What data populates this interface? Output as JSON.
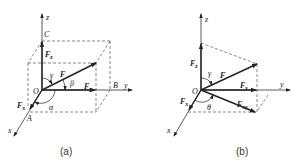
{
  "figure": {
    "panels": [
      {
        "id": "a",
        "caption": "(a)",
        "labels": {
          "z": "z",
          "y": "y",
          "x": "x",
          "origin": "O",
          "C": "C",
          "B": "B",
          "A": "A",
          "F": "F",
          "Fz": "F",
          "Fz_sub": "z",
          "Fy": "F",
          "Fy_sub": "y",
          "Fx": "F",
          "Fx_sub": "x",
          "alpha": "α",
          "beta": "β",
          "gamma": "γ"
        }
      },
      {
        "id": "b",
        "caption": "(b)",
        "labels": {
          "z": "z",
          "y": "y",
          "x": "x",
          "origin": "O",
          "F": "F",
          "Fz": "F",
          "Fz_sub": "z",
          "Fy": "F",
          "Fy_sub": "y",
          "Fx": "F",
          "Fx_sub": "x",
          "Fxy": "F",
          "Fxy_sub": "xy",
          "gamma": "γ",
          "theta": "θ"
        }
      }
    ],
    "colors": {
      "line": "#333333",
      "dash": "#555555",
      "arrow": "#222222"
    }
  }
}
